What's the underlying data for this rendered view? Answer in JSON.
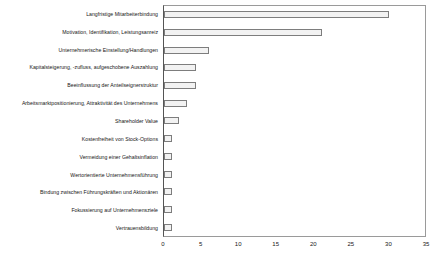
{
  "chart_data": {
    "type": "bar",
    "orientation": "horizontal",
    "title": "",
    "xlabel": "",
    "ylabel": "",
    "xlim": [
      0,
      35
    ],
    "xticks": [
      0,
      5,
      10,
      15,
      20,
      25,
      30,
      35
    ],
    "grid": false,
    "legend": null,
    "bar_fill_color": "#f2f2f2",
    "bar_border_color": "#7d7d7d",
    "axis_color": "#9a9a9a",
    "background_color": "#ffffff",
    "categories": [
      "Langfristige Mitarbeiterbindung",
      "Motivation, Identifikation, Leistungsanreiz",
      "Unternehmerische Einstellung/Handlungen",
      "Kapitalsteigerung, -zufluss, aufgeschobene Auszahlung",
      "Beeinflussung der Anteilseignerstruktur",
      "Arbeitsmarktpositionierung, Attraktivität des Unternehmens",
      "Shareholder Value",
      "Kostenfreiheit von Stock-Options",
      "Vermeidung einer Gehaltsinflation",
      "Wertorientierte Unternehmensführung",
      "Bindung zwischen Führungskräften und Aktionären",
      "Fokussierung auf Unternehmensziele",
      "Vertrauensbildung"
    ],
    "values": [
      30,
      21,
      6,
      4.3,
      4.3,
      3.1,
      2,
      1,
      1,
      1,
      1,
      1,
      1
    ]
  }
}
